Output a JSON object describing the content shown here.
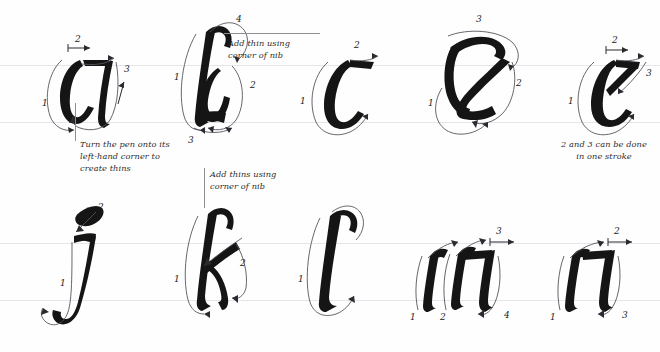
{
  "sheet": {
    "title": "Italic calligraphy lowercase stroke-order sheet",
    "background": "#fefefe",
    "ink_color": "#151515",
    "guide_color": "#e6e6ea",
    "arrow_color": "#4a4a52"
  },
  "guides": [
    {
      "name": "row1-x-height-line",
      "y": 65
    },
    {
      "name": "row1-baseline",
      "y": 122
    },
    {
      "name": "row2-x-height-line",
      "y": 243
    },
    {
      "name": "row2-baseline",
      "y": 300
    }
  ],
  "rows": [
    {
      "name": "row-1",
      "letters": [
        {
          "glyph": "a",
          "name": "letter-a",
          "stroke_numbers": [
            "1",
            "2",
            "3"
          ],
          "stroke_count": 3
        },
        {
          "glyph": "b",
          "name": "letter-b",
          "stroke_numbers": [
            "1",
            "2",
            "3",
            "4"
          ],
          "stroke_count": 4
        },
        {
          "glyph": "c",
          "name": "letter-c",
          "stroke_numbers": [
            "1",
            "2"
          ],
          "stroke_count": 2
        },
        {
          "glyph": "d",
          "name": "letter-d",
          "stroke_numbers": [
            "1",
            "2",
            "3"
          ],
          "stroke_count": 3
        },
        {
          "glyph": "e",
          "name": "letter-e",
          "stroke_numbers": [
            "1",
            "2",
            "3"
          ],
          "stroke_count": 3
        }
      ]
    },
    {
      "name": "row-2",
      "letters": [
        {
          "glyph": "j",
          "name": "letter-j",
          "stroke_numbers": [
            "1",
            "2"
          ],
          "stroke_count": 2
        },
        {
          "glyph": "k",
          "name": "letter-k",
          "stroke_numbers": [
            "1",
            "2"
          ],
          "stroke_count": 2
        },
        {
          "glyph": "l",
          "name": "letter-l",
          "stroke_numbers": [
            "1"
          ],
          "stroke_count": 1
        },
        {
          "glyph": "m",
          "name": "letter-m",
          "stroke_numbers": [
            "1",
            "2",
            "3",
            "4"
          ],
          "stroke_count": 4
        },
        {
          "glyph": "n",
          "name": "letter-n",
          "stroke_numbers": [
            "1",
            "2",
            "3"
          ],
          "stroke_count": 3
        }
      ]
    }
  ],
  "annotations": {
    "a_note": "Turn the pen onto its\nleft-hand corner to\ncreate thins",
    "b_note": "Add thin using\ncorner of nib",
    "k_note": "Add thins using\ncorner of nib",
    "e_note": "2 and 3 can be done\nin one stroke"
  }
}
